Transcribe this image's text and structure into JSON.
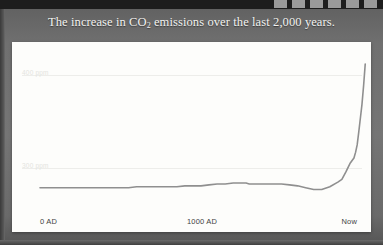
{
  "slide": {
    "title_before": "The increase in CO",
    "title_sub": "2",
    "title_after": " emissions over the last 2,000 years."
  },
  "toolbar": {
    "chips": [
      "toolbar-chip",
      "toolbar-chip",
      "toolbar-chip",
      "toolbar-chip",
      "toolbar-chip",
      "toolbar-chip"
    ]
  },
  "colors": {
    "background": "#6d6d6d",
    "panel": "#fdfdfb",
    "curve": "#8f8f8f",
    "gridline": "#ededea",
    "title_text": "#f2f2f0",
    "axis_text": "#3f3f3f",
    "ylabel_text": "#e4e4e0"
  },
  "chart_data": {
    "type": "line",
    "title": "The increase in CO2 emissions over the last 2,000 years.",
    "xlabel": "",
    "ylabel": "",
    "grid": true,
    "legend": false,
    "xtick_labels": [
      "0 AD",
      "1000 AD",
      "Now"
    ],
    "xtick_values": [
      0,
      1000,
      2000
    ],
    "ytick_labels": [
      "400 ppm",
      "300 ppm"
    ],
    "ytick_values": [
      400,
      300
    ],
    "xlim": [
      0,
      2000
    ],
    "ylim": [
      255,
      425
    ],
    "series": [
      {
        "name": "Atmospheric CO2 concentration",
        "x": [
          0,
          50,
          100,
          150,
          200,
          250,
          300,
          350,
          400,
          450,
          500,
          550,
          600,
          650,
          700,
          750,
          800,
          850,
          900,
          950,
          1000,
          1050,
          1100,
          1150,
          1200,
          1250,
          1280,
          1300,
          1350,
          1400,
          1450,
          1500,
          1550,
          1600,
          1650,
          1700,
          1750,
          1800,
          1850,
          1875,
          1900,
          1925,
          1950,
          1960,
          1970,
          1980,
          1990,
          2000,
          2010,
          2020
        ],
        "values": [
          279,
          279,
          279,
          279,
          279,
          279,
          279,
          279,
          279,
          279,
          279,
          279,
          280,
          280,
          280,
          280,
          280,
          280,
          281,
          281,
          281,
          282,
          283,
          283,
          284,
          284,
          284,
          283,
          283,
          283,
          283,
          283,
          282,
          281,
          279,
          277,
          277,
          280,
          285,
          288,
          296,
          305,
          311,
          317,
          325,
          339,
          354,
          369,
          389,
          412
        ]
      }
    ]
  }
}
